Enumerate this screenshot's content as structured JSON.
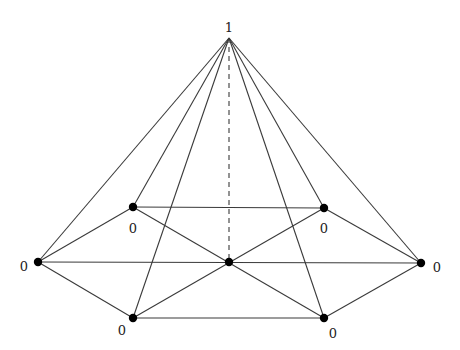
{
  "diagram": {
    "nodes": [
      {
        "id": "apex",
        "x": 229,
        "y": 38,
        "label": "1",
        "lx": 229,
        "ly": 28
      },
      {
        "id": "top-left",
        "x": 133,
        "y": 207,
        "label": "0",
        "lx": 133,
        "ly": 229
      },
      {
        "id": "top-right",
        "x": 324,
        "y": 208,
        "label": "0",
        "lx": 324,
        "ly": 229
      },
      {
        "id": "left",
        "x": 38,
        "y": 262,
        "label": "0",
        "lx": 24,
        "ly": 267
      },
      {
        "id": "center",
        "x": 229,
        "y": 262,
        "label": "",
        "lx": 0,
        "ly": 0
      },
      {
        "id": "right",
        "x": 421,
        "y": 263,
        "label": "0",
        "lx": 437,
        "ly": 268
      },
      {
        "id": "bottom-left",
        "x": 133,
        "y": 318,
        "label": "0",
        "lx": 122,
        "ly": 331
      },
      {
        "id": "bottom-right",
        "x": 324,
        "y": 318,
        "label": "0",
        "lx": 333,
        "ly": 334
      }
    ],
    "edges": [
      [
        "apex",
        "left"
      ],
      [
        "apex",
        "top-left"
      ],
      [
        "apex",
        "bottom-left"
      ],
      [
        "apex",
        "bottom-right"
      ],
      [
        "apex",
        "top-right"
      ],
      [
        "apex",
        "right"
      ],
      [
        "left",
        "top-left"
      ],
      [
        "left",
        "bottom-left"
      ],
      [
        "right",
        "top-right"
      ],
      [
        "right",
        "bottom-right"
      ],
      [
        "top-left",
        "top-right"
      ],
      [
        "bottom-left",
        "bottom-right"
      ],
      [
        "left",
        "right"
      ],
      [
        "top-left",
        "bottom-right"
      ],
      [
        "top-right",
        "bottom-left"
      ]
    ],
    "dashed_edges": [
      [
        "apex",
        "center"
      ]
    ],
    "colors": {
      "edge": "#3a3a3a",
      "node": "#000000",
      "label": "#222222"
    }
  }
}
